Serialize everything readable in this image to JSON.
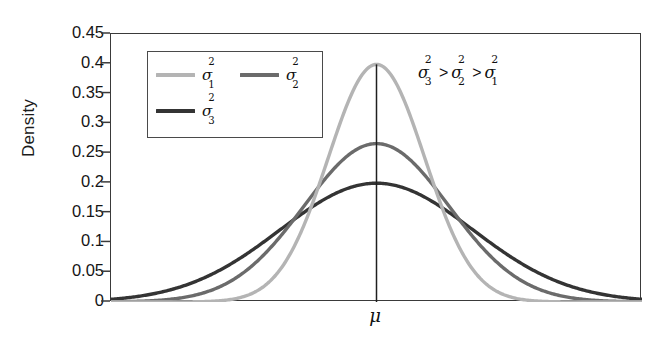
{
  "chart_data": {
    "type": "line",
    "title": "",
    "xlabel": "",
    "ylabel": "Density",
    "xlim": [
      -5.5,
      5.5
    ],
    "ylim": [
      0,
      0.45
    ],
    "grid": false,
    "x_tick_labels": [
      "μ"
    ],
    "x_tick_values": [
      0
    ],
    "y_tick_labels": [
      "0.45",
      "0.4",
      "0.35",
      "0.3",
      "0.25",
      "0.2",
      "0.15",
      "0.1",
      "0.05",
      "0"
    ],
    "y_tick_values": [
      0.45,
      0.4,
      0.35,
      0.3,
      0.25,
      0.2,
      0.15,
      0.1,
      0.05,
      0
    ],
    "legend_position": "upper left",
    "annotation": "σ₃² > σ₂² > σ₁²",
    "center_line_label": "μ",
    "series": [
      {
        "name": "σ₁²",
        "sigma": 1.0,
        "variance": 1.0,
        "mean": 0,
        "peak_value": 0.399,
        "color": "#b4b4b4",
        "x": [
          -5.5,
          -5,
          -4.5,
          -4,
          -3.5,
          -3,
          -2.5,
          -2,
          -1.5,
          -1,
          -0.5,
          0,
          0.5,
          1,
          1.5,
          2,
          2.5,
          3,
          3.5,
          4,
          4.5,
          5,
          5.5
        ],
        "values": [
          0.0,
          0.0,
          0.0,
          0.0001,
          0.0009,
          0.0044,
          0.0175,
          0.054,
          0.1295,
          0.242,
          0.3521,
          0.3989,
          0.3521,
          0.242,
          0.1295,
          0.054,
          0.0175,
          0.0044,
          0.0009,
          0.0001,
          0.0,
          0.0,
          0.0
        ]
      },
      {
        "name": "σ₂²",
        "sigma": 1.5,
        "variance": 2.25,
        "mean": 0,
        "peak_value": 0.266,
        "color": "#6b6b6b",
        "x": [
          -5.5,
          -5,
          -4.5,
          -4,
          -3.5,
          -3,
          -2.5,
          -2,
          -1.5,
          -1,
          -0.5,
          0,
          0.5,
          1,
          1.5,
          2,
          2.5,
          3,
          3.5,
          4,
          4.5,
          5,
          5.5
        ],
        "values": [
          0.0005,
          0.0018,
          0.0051,
          0.013,
          0.0293,
          0.0596,
          0.1093,
          0.1826,
          0.2417,
          0.213,
          0.2516,
          0.266,
          0.2516,
          0.213,
          0.2417,
          0.1826,
          0.1093,
          0.0596,
          0.0293,
          0.013,
          0.0051,
          0.0018,
          0.0005
        ]
      },
      {
        "name": "σ₃²",
        "sigma": 2.0,
        "variance": 4.0,
        "mean": 0,
        "peak_value": 0.199,
        "color": "#343434",
        "x": [
          -5.5,
          -5,
          -4.5,
          -4,
          -3.5,
          -3,
          -2.5,
          -2,
          -1.5,
          -1,
          -0.5,
          0,
          0.5,
          1,
          1.5,
          2,
          2.5,
          3,
          3.5,
          4,
          4.5,
          5,
          5.5
        ],
        "values": [
          0.0043,
          0.0088,
          0.0158,
          0.027,
          0.0427,
          0.0648,
          0.0913,
          0.121,
          0.1506,
          0.176,
          0.1933,
          0.1995,
          0.1933,
          0.176,
          0.1506,
          0.121,
          0.0913,
          0.0648,
          0.0427,
          0.027,
          0.0158,
          0.0088,
          0.0043
        ]
      }
    ]
  },
  "axis": {
    "ylabel": "Density",
    "yticks": [
      "0.45",
      "0.4",
      "0.35",
      "0.3",
      "0.25",
      "0.2",
      "0.15",
      "0.1",
      "0.05",
      "0"
    ]
  },
  "legend": {
    "entries": [
      {
        "symbol": "σ",
        "sup": "2",
        "sub": "1",
        "color": "#b4b4b4"
      },
      {
        "symbol": "σ",
        "sup": "2",
        "sub": "2",
        "color": "#6b6b6b"
      },
      {
        "symbol": "σ",
        "sup": "2",
        "sub": "3",
        "color": "#343434"
      }
    ]
  },
  "annotation": {
    "sigma": "σ",
    "gt": ">",
    "order": [
      "3",
      "2",
      "1"
    ],
    "sup": "2"
  },
  "mu": {
    "label": "μ"
  }
}
